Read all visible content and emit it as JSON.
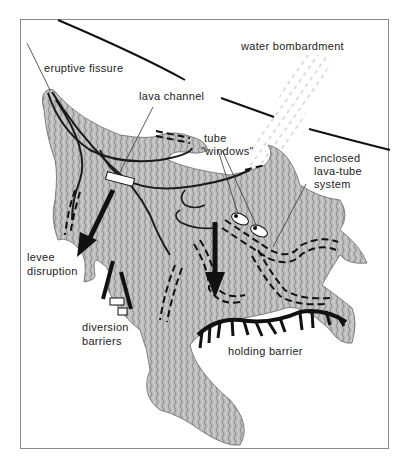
{
  "diagram": {
    "type": "lava flow diversion strategies",
    "colors": {
      "lava_fill": "#b8b8b8",
      "lava_texture": "#8e8e8e",
      "line": "#111111",
      "frame": "#8a8a8a",
      "water": "#bdbdbd"
    },
    "labels": {
      "eruptive_fissure": "eruptive fissure",
      "lava_channel": "lava channel",
      "water_bombardment": "water bombardment",
      "tube_windows_line1": "tube",
      "tube_windows_line2": "\"windows\"",
      "enclosed_line1": "enclosed",
      "enclosed_line2": "lava-tube",
      "enclosed_line3": "system",
      "levee_line1": "levee",
      "levee_line2": "disruption",
      "diversion_line1": "diversion",
      "diversion_line2": "barriers",
      "holding_barrier": "holding barrier"
    }
  }
}
